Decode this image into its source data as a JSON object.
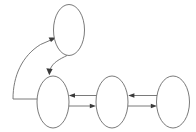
{
  "diagram": {
    "canvas": {
      "width": 196,
      "height": 132,
      "background": "#ffffff"
    },
    "style": {
      "node_stroke": "#6b6b6b",
      "node_fill": "#ffffff",
      "edge_stroke": "#6b6b6b",
      "arrowhead_fill": "#3a3a3a",
      "stroke_width": 0.9
    },
    "nodes": [
      {
        "id": "n1",
        "label": "",
        "cx": 69,
        "cy": 30,
        "rx": 15.5,
        "ry": 25.5,
        "name": "node-top"
      },
      {
        "id": "n2",
        "label": "",
        "cx": 53,
        "cy": 102,
        "rx": 16,
        "ry": 26,
        "name": "node-bottom-left"
      },
      {
        "id": "n3",
        "label": "",
        "cx": 112,
        "cy": 102,
        "rx": 16,
        "ry": 26,
        "name": "node-bottom-middle"
      },
      {
        "id": "n4",
        "label": "",
        "cx": 173,
        "cy": 102,
        "rx": 16.5,
        "ry": 26,
        "name": "node-bottom-right"
      }
    ],
    "edges": [
      {
        "id": "e1",
        "from": "n2",
        "to": "n1",
        "label": "",
        "shape": "long-curve-left",
        "direction": "up",
        "name": "edge-bottom-left-to-top"
      },
      {
        "id": "e2",
        "from": "n1",
        "to": "n2",
        "label": "",
        "shape": "short-curve",
        "direction": "down",
        "name": "edge-top-to-bottom-left"
      },
      {
        "id": "e3",
        "from": "n3",
        "to": "n2",
        "label": "",
        "shape": "straight",
        "direction": "left",
        "name": "edge-middle-to-left"
      },
      {
        "id": "e4",
        "from": "n2",
        "to": "n3",
        "label": "",
        "shape": "straight",
        "direction": "right",
        "name": "edge-left-to-middle"
      },
      {
        "id": "e5",
        "from": "n4",
        "to": "n3",
        "label": "",
        "shape": "straight",
        "direction": "left",
        "name": "edge-right-to-middle"
      },
      {
        "id": "e6",
        "from": "n3",
        "to": "n4",
        "label": "",
        "shape": "straight",
        "direction": "right",
        "name": "edge-middle-to-right"
      }
    ]
  }
}
